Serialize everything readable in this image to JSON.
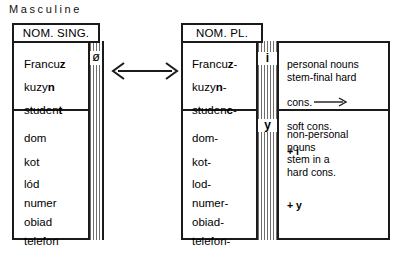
{
  "title": "Masculine",
  "singular": {
    "header": "NOM. SING.",
    "ending_label": "ø",
    "group_personal": [
      "Francuz",
      "kuzyn",
      "student"
    ],
    "group_personal_bold": [
      "z",
      "n",
      "t"
    ],
    "group_nonpersonal": [
      "dom",
      "kot",
      "lód",
      "numer",
      "obiad",
      "telefon"
    ]
  },
  "plural": {
    "header": "NOM. PL.",
    "ending_personal": "i",
    "ending_nonpersonal": "y",
    "group_personal": [
      "Francuz-",
      "kuzyn-",
      "studenc-"
    ],
    "group_personal_bold": [
      "z",
      "n",
      "c"
    ],
    "group_nonpersonal": [
      "dom-",
      "kot-",
      "lod-",
      "numer-",
      "obiad-",
      "telefon-"
    ]
  },
  "notes": {
    "personal": "personal nouns\nstem-final hard",
    "personal_rule_left": "cons.",
    "personal_rule_right": "soft cons.",
    "personal_suffix": "+ i",
    "nonpersonal": "non-personal\nnouns\nstem in a\nhard cons.",
    "nonpersonal_suffix": "+ y"
  },
  "arrow": {
    "name": "double-headed-arrow"
  },
  "colors": {
    "ink": "#1a1a1a",
    "hatch": "#6e6e6e",
    "background": "#ffffff"
  }
}
